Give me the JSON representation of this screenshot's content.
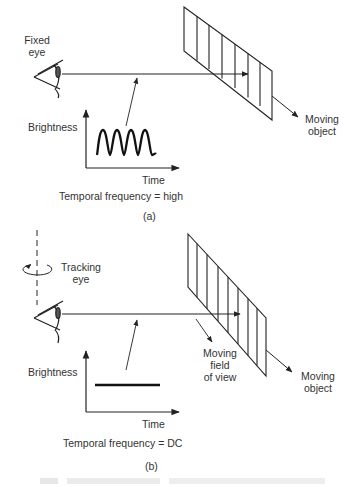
{
  "panel_a": {
    "eye_label_line1": "Fixed",
    "eye_label_line2": "eye",
    "object_label_line1": "Moving",
    "object_label_line2": "object",
    "y_axis_label": "Brightness",
    "x_axis_label": "Time",
    "frequency_text": "Temporal frequency = high",
    "panel_label": "(a)",
    "signal": "sinusoidal",
    "cycles": 4
  },
  "panel_b": {
    "eye_label_line1": "Tracking",
    "eye_label_line2": "eye",
    "fov_label_line1": "Moving",
    "fov_label_line2": "field",
    "fov_label_line3": "of view",
    "object_label_line1": "Moving",
    "object_label_line2": "object",
    "y_axis_label": "Brightness",
    "x_axis_label": "Time",
    "frequency_text": "Temporal frequency = DC",
    "panel_label": "(b)",
    "signal": "constant"
  },
  "colors": {
    "ink": "#222222",
    "background": "#ffffff"
  }
}
